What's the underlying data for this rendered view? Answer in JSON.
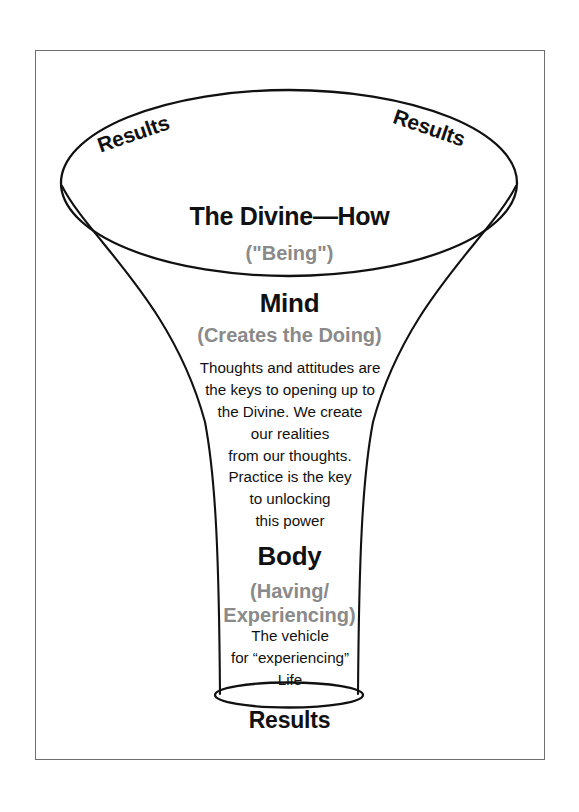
{
  "diagram": {
    "outline_color": "#111111",
    "frame_color": "#6e6e6e",
    "muted_text_color": "#8a8a8a",
    "text_color": "#111111",
    "background": "#ffffff"
  },
  "top_bowl": {
    "results_left": "Results",
    "results_right": "Results",
    "title": "The Divine—How",
    "subtitle": "(\"Being\")"
  },
  "mind_section": {
    "title": "Mind",
    "subtitle": "(Creates the Doing)",
    "body_lines": [
      "Thoughts and attitudes are",
      "the keys to opening up to",
      "the Divine. We create",
      "our realities",
      "from our thoughts.",
      "Practice is the key",
      "to unlocking",
      "this power"
    ]
  },
  "body_section": {
    "title": "Body",
    "subtitle_lines": [
      "(Having/",
      "Experiencing)"
    ],
    "body_lines": [
      "The vehicle",
      "for “experiencing”",
      "Life"
    ]
  },
  "bottom": {
    "results": "Results"
  }
}
